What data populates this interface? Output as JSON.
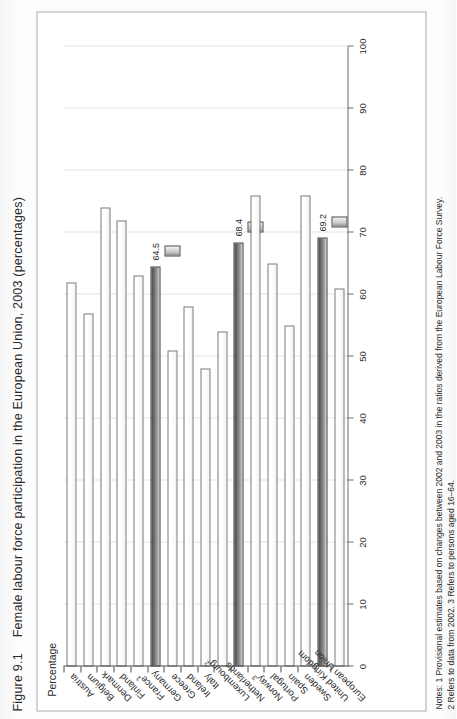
{
  "figure": {
    "number": "Figure 9.1",
    "caption": "Female labour force participation in the European Union, 2003 (percentages)"
  },
  "notes": {
    "line1": "Notes: 1 Provisional estimates based on changes between 2002 and 2003 in the ratios derived from the European Labour Force Survey.",
    "line2": "2 Refers to data from 2002. 3 Refers to persons aged 16–64."
  },
  "colors": {
    "bar_fill": "#ffffff",
    "bar_stroke": "#7a7a7a",
    "highlight_fill": "#6f6f6f",
    "highlight_stroke": "#3d3d3d",
    "grid": "#e3e3e6",
    "axis": "#6d6d6d",
    "text": "#231f20"
  },
  "chart_data": {
    "type": "bar",
    "orientation": "horizontal",
    "title": "Female labour force participation in the European Union, 2003 (percentages)",
    "xlabel": "",
    "ylabel": "Percentage",
    "axis_title": "Percentage",
    "ylim": [
      0,
      100
    ],
    "axis_reversed": true,
    "tick_values": [
      100,
      90,
      80,
      70,
      60,
      50,
      40,
      30,
      20,
      10,
      0
    ],
    "grid": true,
    "legend": "none",
    "categories": [
      "Austria",
      "Belgium",
      "Denmark",
      "Finland",
      "France",
      "Germany",
      "Greece",
      "Ireland",
      "Italy",
      "Luxembourg",
      "Netherlands",
      "Norway",
      "Portugal",
      "Spain",
      "Sweden",
      "United Kingdom",
      "European Union"
    ],
    "category_footnotes": [
      "",
      "",
      "",
      "",
      "1",
      "",
      "",
      "",
      "",
      "2",
      "",
      "3",
      "",
      "",
      "",
      "",
      ""
    ],
    "values": [
      62,
      57,
      74,
      72,
      63,
      64.5,
      51,
      58,
      48,
      54,
      68.4,
      76,
      65,
      55,
      76,
      69.2,
      61
    ],
    "highlighted": [
      "Germany",
      "Netherlands",
      "United Kingdom"
    ],
    "data_labels": [
      {
        "category": "Germany",
        "value": "64.5"
      },
      {
        "category": "Netherlands",
        "value": "68.4"
      },
      {
        "category": "United Kingdom",
        "value": "69.2"
      }
    ]
  }
}
